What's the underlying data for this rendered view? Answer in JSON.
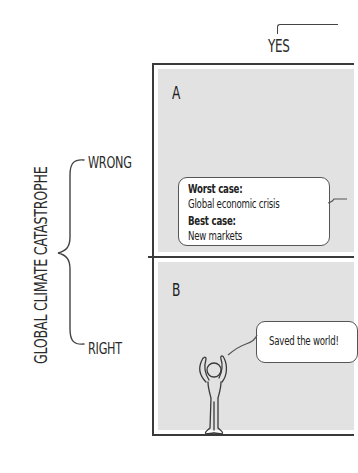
{
  "header": {
    "column_label": "YES"
  },
  "axis": {
    "title": "GLOBAL CLIMATE CATASTROPHE",
    "rows": [
      {
        "label": "WRONG"
      },
      {
        "label": "RIGHT"
      }
    ]
  },
  "panels": [
    {
      "id": "A",
      "letter": "A",
      "bubble": {
        "worst_label": "Worst case:",
        "worst_value": "Global economic crisis",
        "best_label": "Best case:",
        "best_value": "New markets"
      }
    },
    {
      "id": "B",
      "letter": "B",
      "bubble": {
        "text": "Saved the world!"
      },
      "figure": "cheering-person"
    }
  ],
  "colors": {
    "panel_fill": "#e2e2e2",
    "line": "#3a3a3a",
    "bubble_fill": "#ffffff"
  }
}
